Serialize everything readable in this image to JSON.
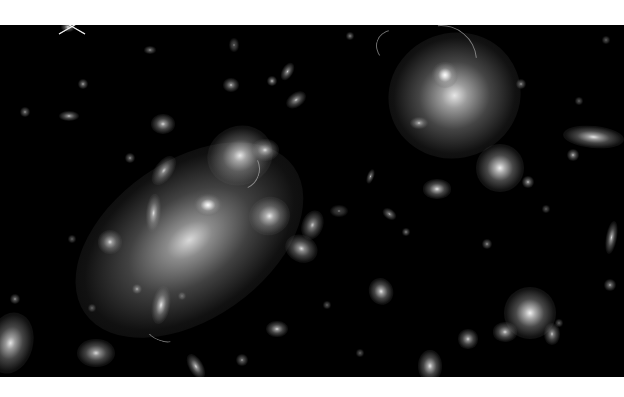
{
  "image": {
    "subject": "galaxy cluster deep-field photograph (grayscale)",
    "background": "#ffffff",
    "field_color": "#000000",
    "field": {
      "x": 0,
      "y": 25,
      "w": 624,
      "h": 352
    }
  },
  "galaxies": [
    {
      "x": 190,
      "y": 240,
      "rx": 58,
      "ry": 36,
      "rot": -35,
      "b": 0.85,
      "halo": 1.0
    },
    {
      "x": 208,
      "y": 205,
      "rx": 9,
      "ry": 7,
      "rot": 0,
      "b": 1.0,
      "halo": 0.5
    },
    {
      "x": 455,
      "y": 95,
      "rx": 32,
      "ry": 30,
      "rot": -20,
      "b": 0.9,
      "halo": 0.9
    },
    {
      "x": 445,
      "y": 75,
      "rx": 8,
      "ry": 8,
      "rot": 0,
      "b": 1.0,
      "halo": 0.5
    },
    {
      "x": 240,
      "y": 155,
      "rx": 18,
      "ry": 16,
      "rot": -20,
      "b": 0.9,
      "halo": 0.7
    },
    {
      "x": 265,
      "y": 150,
      "rx": 9,
      "ry": 7,
      "rot": 0,
      "b": 0.85,
      "halo": 0.5
    },
    {
      "x": 270,
      "y": 216,
      "rx": 12,
      "ry": 11,
      "rot": -20,
      "b": 0.9,
      "halo": 0.6
    },
    {
      "x": 500,
      "y": 168,
      "rx": 14,
      "ry": 14,
      "rot": 0,
      "b": 0.95,
      "halo": 0.6
    },
    {
      "x": 530,
      "y": 313,
      "rx": 15,
      "ry": 15,
      "rot": 0,
      "b": 0.95,
      "halo": 0.6
    },
    {
      "x": 593,
      "y": 137,
      "rx": 19,
      "ry": 7,
      "rot": 5,
      "b": 0.9,
      "halo": 0.5
    },
    {
      "x": 10,
      "y": 343,
      "rx": 13,
      "ry": 18,
      "rot": 15,
      "b": 0.9,
      "halo": 0.6
    },
    {
      "x": 96,
      "y": 353,
      "rx": 12,
      "ry": 9,
      "rot": 0,
      "b": 0.85,
      "halo": 0.5
    },
    {
      "x": 161,
      "y": 305,
      "rx": 6,
      "ry": 13,
      "rot": 10,
      "b": 0.9,
      "halo": 0.4
    },
    {
      "x": 153,
      "y": 213,
      "rx": 5,
      "ry": 13,
      "rot": 5,
      "b": 0.85,
      "halo": 0.4
    },
    {
      "x": 164,
      "y": 170,
      "rx": 6,
      "ry": 11,
      "rot": 35,
      "b": 0.8,
      "halo": 0.4
    },
    {
      "x": 163,
      "y": 124,
      "rx": 8,
      "ry": 7,
      "rot": 0,
      "b": 0.85,
      "halo": 0.4
    },
    {
      "x": 301,
      "y": 248,
      "rx": 11,
      "ry": 9,
      "rot": 25,
      "b": 0.85,
      "halo": 0.4
    },
    {
      "x": 312,
      "y": 225,
      "rx": 7,
      "ry": 10,
      "rot": 20,
      "b": 0.8,
      "halo": 0.4
    },
    {
      "x": 381,
      "y": 291,
      "rx": 8,
      "ry": 9,
      "rot": -20,
      "b": 0.9,
      "halo": 0.4
    },
    {
      "x": 277,
      "y": 329,
      "rx": 8,
      "ry": 6,
      "rot": 0,
      "b": 0.85,
      "halo": 0.3
    },
    {
      "x": 437,
      "y": 189,
      "rx": 10,
      "ry": 7,
      "rot": 0,
      "b": 0.9,
      "halo": 0.3
    },
    {
      "x": 505,
      "y": 332,
      "rx": 9,
      "ry": 7,
      "rot": 0,
      "b": 0.85,
      "halo": 0.3
    },
    {
      "x": 468,
      "y": 339,
      "rx": 7,
      "ry": 7,
      "rot": 0,
      "b": 0.85,
      "halo": 0.3
    },
    {
      "x": 430,
      "y": 366,
      "rx": 8,
      "ry": 11,
      "rot": 0,
      "b": 0.9,
      "halo": 0.4
    },
    {
      "x": 552,
      "y": 334,
      "rx": 6,
      "ry": 8,
      "rot": 0,
      "b": 0.8,
      "halo": 0.3
    },
    {
      "x": 573,
      "y": 155,
      "rx": 5,
      "ry": 5,
      "rot": 0,
      "b": 0.8,
      "halo": 0.2
    },
    {
      "x": 528,
      "y": 182,
      "rx": 5,
      "ry": 5,
      "rot": 0,
      "b": 0.8,
      "halo": 0.2
    },
    {
      "x": 611,
      "y": 237,
      "rx": 4,
      "ry": 12,
      "rot": 10,
      "b": 0.85,
      "halo": 0.3
    },
    {
      "x": 610,
      "y": 285,
      "rx": 5,
      "ry": 5,
      "rot": 0,
      "b": 0.75,
      "halo": 0.2
    },
    {
      "x": 521,
      "y": 84,
      "rx": 4,
      "ry": 4,
      "rot": 0,
      "b": 0.7,
      "halo": 0.2
    },
    {
      "x": 110,
      "y": 242,
      "rx": 9,
      "ry": 9,
      "rot": 0,
      "b": 0.85,
      "halo": 0.3
    },
    {
      "x": 137,
      "y": 289,
      "rx": 4,
      "ry": 4,
      "rot": 0,
      "b": 0.75,
      "halo": 0.2
    },
    {
      "x": 130,
      "y": 158,
      "rx": 4,
      "ry": 4,
      "rot": 0,
      "b": 0.7,
      "halo": 0.2
    },
    {
      "x": 69,
      "y": 116,
      "rx": 8,
      "ry": 4,
      "rot": 0,
      "b": 0.8,
      "halo": 0.2
    },
    {
      "x": 83,
      "y": 84,
      "rx": 4,
      "ry": 4,
      "rot": 0,
      "b": 0.75,
      "halo": 0.2
    },
    {
      "x": 25,
      "y": 112,
      "rx": 4,
      "ry": 4,
      "rot": 0,
      "b": 0.7,
      "halo": 0.2
    },
    {
      "x": 15,
      "y": 299,
      "rx": 4,
      "ry": 4,
      "rot": 0,
      "b": 0.7,
      "halo": 0.2
    },
    {
      "x": 68,
      "y": 27,
      "rx": 5,
      "ry": 4,
      "rot": 0,
      "b": 0.9,
      "halo": 0.3
    },
    {
      "x": 287,
      "y": 72,
      "rx": 4,
      "ry": 7,
      "rot": 30,
      "b": 0.8,
      "halo": 0.3
    },
    {
      "x": 296,
      "y": 100,
      "rx": 8,
      "ry": 5,
      "rot": -35,
      "b": 0.8,
      "halo": 0.3
    },
    {
      "x": 272,
      "y": 81,
      "rx": 4,
      "ry": 4,
      "rot": 0,
      "b": 0.8,
      "halo": 0.2
    },
    {
      "x": 231,
      "y": 85,
      "rx": 6,
      "ry": 5,
      "rot": 0,
      "b": 0.8,
      "halo": 0.3
    },
    {
      "x": 234,
      "y": 45,
      "rx": 4,
      "ry": 6,
      "rot": 0,
      "b": 0.6,
      "halo": 0.2
    },
    {
      "x": 350,
      "y": 36,
      "rx": 3,
      "ry": 3,
      "rot": 0,
      "b": 0.7,
      "halo": 0.2
    },
    {
      "x": 371,
      "y": 176,
      "rx": 3,
      "ry": 6,
      "rot": 20,
      "b": 0.75,
      "halo": 0.2
    },
    {
      "x": 389,
      "y": 214,
      "rx": 6,
      "ry": 4,
      "rot": 35,
      "b": 0.75,
      "halo": 0.2
    },
    {
      "x": 419,
      "y": 123,
      "rx": 7,
      "ry": 5,
      "rot": 0,
      "b": 0.8,
      "halo": 0.2
    },
    {
      "x": 487,
      "y": 244,
      "rx": 4,
      "ry": 4,
      "rot": 0,
      "b": 0.7,
      "halo": 0.2
    },
    {
      "x": 406,
      "y": 232,
      "rx": 3,
      "ry": 3,
      "rot": 0,
      "b": 0.7,
      "halo": 0.2
    },
    {
      "x": 196,
      "y": 367,
      "rx": 5,
      "ry": 10,
      "rot": -30,
      "b": 0.85,
      "halo": 0.3
    },
    {
      "x": 242,
      "y": 360,
      "rx": 5,
      "ry": 5,
      "rot": 0,
      "b": 0.7,
      "halo": 0.2
    },
    {
      "x": 339,
      "y": 211,
      "rx": 7,
      "ry": 5,
      "rot": 0,
      "b": 0.55,
      "halo": 0.2
    },
    {
      "x": 92,
      "y": 308,
      "rx": 3,
      "ry": 3,
      "rot": 0,
      "b": 0.6,
      "halo": 0.2
    },
    {
      "x": 182,
      "y": 296,
      "rx": 3,
      "ry": 3,
      "rot": 0,
      "b": 0.6,
      "halo": 0.2
    },
    {
      "x": 559,
      "y": 323,
      "rx": 3,
      "ry": 3,
      "rot": 0,
      "b": 0.6,
      "halo": 0.2
    },
    {
      "x": 546,
      "y": 209,
      "rx": 3,
      "ry": 3,
      "rot": 0,
      "b": 0.6,
      "halo": 0.2
    },
    {
      "x": 150,
      "y": 50,
      "rx": 5,
      "ry": 3,
      "rot": 0,
      "b": 0.7,
      "halo": 0.2
    },
    {
      "x": 606,
      "y": 40,
      "rx": 3,
      "ry": 3,
      "rot": 0,
      "b": 0.6,
      "halo": 0.2
    },
    {
      "x": 579,
      "y": 101,
      "rx": 3,
      "ry": 3,
      "rot": 0,
      "b": 0.6,
      "halo": 0.2
    },
    {
      "x": 327,
      "y": 305,
      "rx": 3,
      "ry": 3,
      "rot": 0,
      "b": 0.6,
      "halo": 0.2
    },
    {
      "x": 360,
      "y": 353,
      "rx": 3,
      "ry": 3,
      "rot": 0,
      "b": 0.6,
      "halo": 0.2
    },
    {
      "x": 72,
      "y": 239,
      "rx": 3,
      "ry": 3,
      "rot": 0,
      "b": 0.6,
      "halo": 0.2
    }
  ],
  "arcs": [
    {
      "x": 238,
      "y": 168,
      "w": 40,
      "h": 40,
      "rot": 110
    },
    {
      "x": 160,
      "y": 334,
      "w": 26,
      "h": 10,
      "rot": 200
    },
    {
      "x": 440,
      "y": 60,
      "w": 70,
      "h": 70,
      "rot": 40
    },
    {
      "x": 405,
      "y": 50,
      "w": 40,
      "h": 60,
      "rot": -70
    }
  ],
  "star": {
    "x": 72,
    "y": 26,
    "spike_len": 30
  }
}
